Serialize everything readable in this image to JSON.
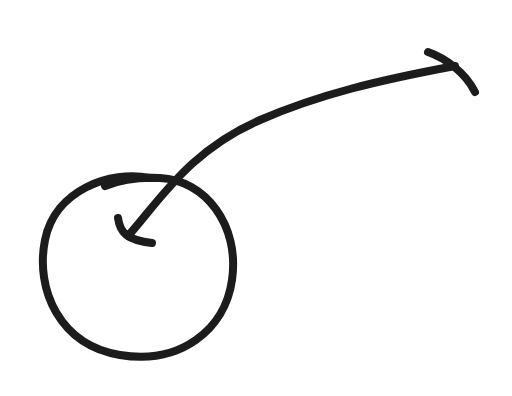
{
  "drawing": {
    "description": "Hand-drawn sketch of a circle with a curved arrow pointing into it",
    "background": "#ffffff",
    "stroke_color": "#1c1c1c",
    "shapes": [
      "circle",
      "curved-arrow"
    ]
  }
}
